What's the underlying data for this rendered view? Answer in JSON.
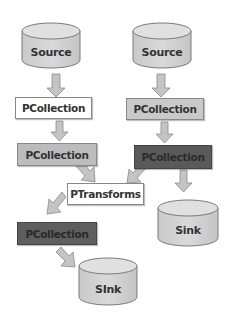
{
  "diagram": {
    "title": "",
    "nodes": [
      {
        "id": "source-left",
        "type": "cylinder",
        "label": "Source"
      },
      {
        "id": "source-right",
        "type": "cylinder",
        "label": "Source"
      },
      {
        "id": "pcollection-left-1",
        "type": "box",
        "label": "PCollection",
        "fill": "#ffffff"
      },
      {
        "id": "pcollection-right-1",
        "type": "box",
        "label": "PCollection",
        "fill": "#c8c8c8"
      },
      {
        "id": "pcollection-left-2",
        "type": "box",
        "label": "PCollection",
        "fill": "#b8b8b8"
      },
      {
        "id": "pcollection-right-2",
        "type": "box",
        "label": "PCollection",
        "fill": "#595959"
      },
      {
        "id": "ptransforms",
        "type": "box",
        "label": "PTransforms",
        "fill": "#ffffff"
      },
      {
        "id": "sink-right",
        "type": "cylinder",
        "label": "Sink"
      },
      {
        "id": "pcollection-left-3",
        "type": "box",
        "label": "PCollection",
        "fill": "#5e5e5e"
      },
      {
        "id": "sink-bottom",
        "type": "cylinder",
        "label": "SInk"
      }
    ],
    "edges": [
      {
        "from": "source-left",
        "to": "pcollection-left-1"
      },
      {
        "from": "source-right",
        "to": "pcollection-right-1"
      },
      {
        "from": "pcollection-left-1",
        "to": "pcollection-left-2"
      },
      {
        "from": "pcollection-right-1",
        "to": "pcollection-right-2"
      },
      {
        "from": "pcollection-left-2",
        "to": "ptransforms"
      },
      {
        "from": "pcollection-right-2",
        "to": "ptransforms"
      },
      {
        "from": "pcollection-right-2",
        "to": "sink-right"
      },
      {
        "from": "ptransforms",
        "to": "pcollection-left-3"
      },
      {
        "from": "pcollection-left-3",
        "to": "sink-bottom"
      }
    ]
  },
  "labels": {
    "source_left": "Source",
    "source_right": "Source",
    "pcol_l1": "PCollection",
    "pcol_r1": "PCollection",
    "pcol_l2": "PCollection",
    "pcol_r2": "PCollection",
    "ptransforms": "PTransforms",
    "sink_right": "Sink",
    "pcol_l3": "PCollection",
    "sink_bottom": "SInk"
  },
  "colors": {
    "cylinder_fill": "#d4d4d4",
    "cylinder_top": "#e2e2e2",
    "arrow_fill": "#c4c4c4",
    "stroke": "#7a7a7a"
  }
}
